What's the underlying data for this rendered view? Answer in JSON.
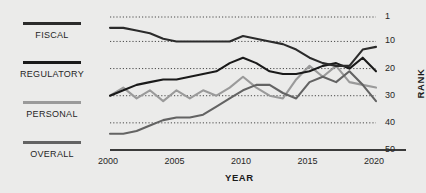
{
  "colors": {
    "background": "#ebebea",
    "text": "#262626",
    "axis": "#3a3a3a",
    "grid": "#4a4a4a",
    "fiscal": "#2b2b2b",
    "regulatory": "#1a1a1a",
    "personal": "#9a9a9a",
    "overall": "#636363"
  },
  "legend": {
    "items": [
      {
        "key": "fiscal",
        "label": "FISCAL",
        "color": "#2b2b2b",
        "top": 22
      },
      {
        "key": "regulatory",
        "label": "REGULATORY",
        "color": "#1a1a1a",
        "top": 61
      },
      {
        "key": "personal",
        "label": "PERSONAL",
        "color": "#9a9a9a",
        "top": 101
      },
      {
        "key": "overall",
        "label": "OVERALL",
        "color": "#636363",
        "top": 141
      }
    ]
  },
  "chart_data": {
    "type": "line",
    "title": "",
    "xlabel": "YEAR",
    "ylabel": "RANK",
    "x": [
      2000,
      2001,
      2002,
      2003,
      2004,
      2005,
      2006,
      2007,
      2008,
      2009,
      2010,
      2011,
      2012,
      2013,
      2014,
      2015,
      2016,
      2017,
      2018,
      2019,
      2020
    ],
    "xlim": [
      2000,
      2020
    ],
    "ylim": [
      1,
      50
    ],
    "y_inverted": true,
    "xticks": [
      2000,
      2005,
      2010,
      2015,
      2020
    ],
    "yticks": [
      1,
      10,
      20,
      30,
      40,
      50
    ],
    "grid": "horizontal-dotted",
    "legend_position": "left",
    "series": [
      {
        "name": "FISCAL",
        "color": "#2b2b2b",
        "values": [
          5,
          5,
          6,
          7,
          9,
          10,
          10,
          10,
          10,
          10,
          8,
          9,
          10,
          11,
          13,
          16,
          18,
          19,
          19,
          13,
          12
        ]
      },
      {
        "name": "REGULATORY",
        "color": "#1a1a1a",
        "values": [
          30,
          28,
          26,
          25,
          24,
          24,
          23,
          22,
          21,
          18,
          16,
          18,
          21,
          22,
          22,
          21,
          19,
          18,
          20,
          16,
          21
        ]
      },
      {
        "name": "PERSONAL",
        "color": "#9a9a9a",
        "values": [
          30,
          27,
          31,
          28,
          32,
          28,
          31,
          28,
          30,
          27,
          23,
          27,
          30,
          31,
          24,
          19,
          23,
          19,
          25,
          26,
          27
        ]
      },
      {
        "name": "OVERALL",
        "color": "#636363",
        "values": [
          44,
          44,
          43,
          41,
          39,
          38,
          38,
          37,
          34,
          31,
          28,
          26,
          26,
          29,
          31,
          25,
          23,
          25,
          21,
          26,
          32
        ]
      }
    ]
  }
}
